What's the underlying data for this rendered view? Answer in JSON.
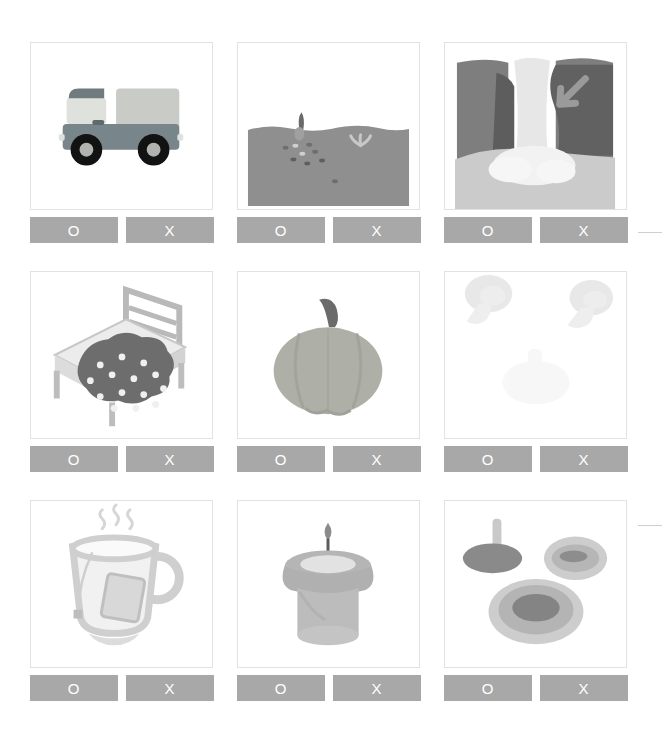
{
  "header": {
    "title": "　　　　　　　　　"
  },
  "answers": {
    "o_label": "O",
    "x_label": "X"
  },
  "colors": {
    "button_bg": "#a8a8a8",
    "button_text": "#ffffff",
    "card_border": "#e2e2e2",
    "page_bg": "#ffffff",
    "edge_rule": "#cfcfcf"
  },
  "cards": [
    {
      "index": 1,
      "illustration_name": "truck-illustration",
      "subject": "truck",
      "o_label": "O",
      "x_label": "X"
    },
    {
      "index": 2,
      "illustration_name": "soil-seeds-illustration",
      "subject": "soil cross-section with seeds and sprout",
      "o_label": "O",
      "x_label": "X"
    },
    {
      "index": 3,
      "illustration_name": "waterfall-illustration",
      "subject": "waterfall with arrow",
      "o_label": "O",
      "x_label": "X"
    },
    {
      "index": 4,
      "illustration_name": "bed-illustration",
      "subject": "bed with polka-dot blanket",
      "o_label": "O",
      "x_label": "X"
    },
    {
      "index": 5,
      "illustration_name": "pumpkin-illustration",
      "subject": "pumpkin",
      "o_label": "O",
      "x_label": "X"
    },
    {
      "index": 6,
      "illustration_name": "faint-mushrooms-illustration",
      "subject": "two faint mushroom shapes",
      "o_label": "O",
      "x_label": "X"
    },
    {
      "index": 7,
      "illustration_name": "teacup-illustration",
      "subject": "teacup with teabag and steam",
      "o_label": "O",
      "x_label": "X"
    },
    {
      "index": 8,
      "illustration_name": "candle-illustration",
      "subject": "lit candle",
      "o_label": "O",
      "x_label": "X"
    },
    {
      "index": 9,
      "illustration_name": "mushroom-caps-illustration",
      "subject": "mushroom cap and gills views",
      "o_label": "O",
      "x_label": "X"
    }
  ],
  "edge_rules": [
    {
      "name": "edge-rule-row1",
      "top": 232,
      "left": 638,
      "width": 24
    },
    {
      "name": "edge-rule-row3",
      "top": 525,
      "left": 638,
      "width": 24
    }
  ]
}
